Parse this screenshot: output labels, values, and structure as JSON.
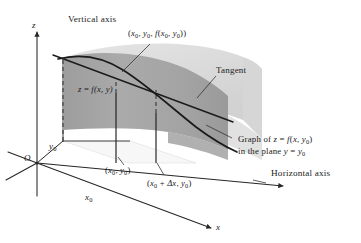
{
  "figure": {
    "background_color": "#ffffff",
    "width": 361,
    "height": 243,
    "line_color": "#262626",
    "surface_upper_color": "#dadada",
    "surface_plane_color": "#a8a8a8",
    "surface_plane_shadow_color": "#8f8f8f"
  },
  "axes": {
    "vertical_axis_label": "Vertical axis",
    "horizontal_axis_label": "Horizontal axis",
    "z_label": "z",
    "x_label": "x",
    "origin_label": "O",
    "x0_tick_label_main": "x",
    "x0_tick_label_sub": "0",
    "y0_tick_label_main": "y",
    "y0_tick_label_sub": "0"
  },
  "labels": {
    "tangency_point": {
      "open": "(",
      "x0": "x",
      "x0_sub": "0",
      "sep1": ", ",
      "y0": "y",
      "y0_sub": "0",
      "sep2": ", ",
      "f": "f",
      "f_open": "(",
      "fx0": "x",
      "fx0_sub": "0",
      "sep3": ", ",
      "fy0": "y",
      "fy0_sub": "0",
      "close": "))"
    },
    "tangent": "Tangent",
    "surface_equation": {
      "z": "z",
      "eq": " = ",
      "f": "f",
      "args": "(x, y)"
    },
    "graph_note_line1": {
      "prefix": "Graph of ",
      "z": "z",
      "eq": " = ",
      "f": "f",
      "open": "(",
      "x": "x",
      "sep": ", ",
      "y0": "y",
      "y0_sub": "0",
      "close": ")"
    },
    "graph_note_line2": {
      "prefix": "in the plane ",
      "y": "y",
      "eq": " = ",
      "y0": "y",
      "y0_sub": "0"
    },
    "base_point_x0y0": {
      "open": "(",
      "x0": "x",
      "x0_sub": "0",
      "sep": ", ",
      "y0": "y",
      "y0_sub": "0",
      "close": ")"
    },
    "base_point_x0dx": {
      "open": "(",
      "x0": "x",
      "x0_sub": "0",
      "plus": " + ",
      "delta": "Δx",
      "sep": ", ",
      "y0": "y",
      "y0_sub": "0",
      "close": ")"
    }
  }
}
